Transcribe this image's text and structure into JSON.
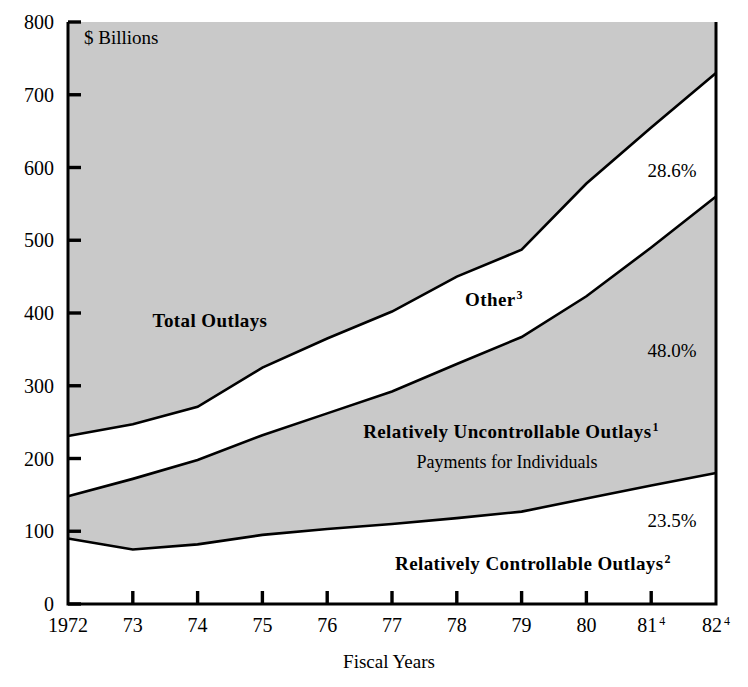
{
  "chart_data": {
    "type": "area",
    "title": "",
    "unit_note": "$ Billions",
    "xlabel": "Fiscal Years",
    "ylabel": "",
    "ylim": [
      0,
      800
    ],
    "yticks": [
      0,
      100,
      200,
      300,
      400,
      500,
      600,
      700,
      800
    ],
    "ytick_labels": [
      "0",
      "100",
      "200",
      "300",
      "400",
      "500",
      "600",
      "700",
      "800"
    ],
    "grid": false,
    "legend_position": "in-plot-annotations",
    "x": [
      "1972",
      "73",
      "74",
      "75",
      "76",
      "77",
      "78",
      "79",
      "80",
      "81",
      "82"
    ],
    "xtick_labels": [
      "1972",
      "73",
      "74",
      "75",
      "76",
      "77",
      "78",
      "79",
      "80",
      "81",
      "82"
    ],
    "xtick_superscripts": [
      "",
      "",
      "",
      "",
      "",
      "",
      "",
      "",
      "",
      "4",
      "4"
    ],
    "series": [
      {
        "name": "Total Outlays",
        "values": [
          231,
          247,
          271,
          325,
          365,
          402,
          450,
          487,
          578,
          655,
          730
        ]
      },
      {
        "name": "Relatively Uncontrollable Outlays (cumulative top)",
        "values": [
          148,
          172,
          198,
          232,
          262,
          292,
          330,
          367,
          423,
          490,
          560
        ]
      },
      {
        "name": "Relatively Controllable Outlays (cumulative top)",
        "values": [
          90,
          75,
          82,
          95,
          103,
          110,
          118,
          127,
          145,
          163,
          180
        ]
      }
    ],
    "band_labels": [
      {
        "name": "total-outlays",
        "text": "Total Outlays",
        "superscript": "",
        "style": "bold",
        "x": 210,
        "y": 327
      },
      {
        "name": "other",
        "text": "Other",
        "superscript": "3",
        "style": "bold",
        "x": 494,
        "y": 306
      },
      {
        "name": "relatively-uncontrollable-outlays",
        "text": "Relatively Uncontrollable Outlays",
        "superscript": "1",
        "style": "bold",
        "x": 511,
        "y": 438
      },
      {
        "name": "payments-for-individuals",
        "text": "Payments for Individuals",
        "superscript": "",
        "style": "plain",
        "x": 507,
        "y": 468
      },
      {
        "name": "relatively-controllable-outlays",
        "text": "Relatively Controllable Outlays",
        "superscript": "2",
        "style": "bold",
        "x": 533,
        "y": 570
      }
    ],
    "percent_labels": [
      {
        "name": "other-share",
        "text": "28.6%",
        "x": 672,
        "y": 177
      },
      {
        "name": "uncontrollable-share",
        "text": "48.0%",
        "x": 672,
        "y": 357
      },
      {
        "name": "controllable-share",
        "text": "23.5%",
        "x": 672,
        "y": 527
      }
    ],
    "colors": {
      "shaded_band": "#c9c9c9",
      "open_band": "#ffffff",
      "line": "#000000",
      "text": "#000000",
      "background": "#ffffff"
    }
  }
}
